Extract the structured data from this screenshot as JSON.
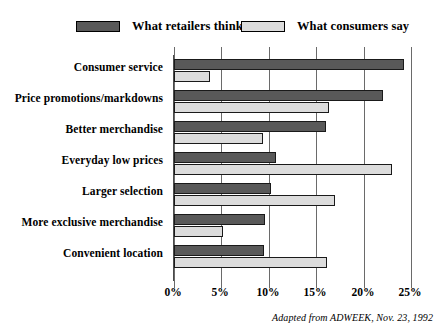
{
  "figure": {
    "caption": "Adapted from ADWEEK, Nov. 23, 1992"
  },
  "legend": {
    "entries": [
      {
        "label": "What retailers think",
        "color": "#595959",
        "swatch_name": "legend-swatch-retailers"
      },
      {
        "label": "What consumers say",
        "color": "#dcdcdc",
        "swatch_name": "legend-swatch-consumers"
      }
    ]
  },
  "axis": {
    "x_ticks": [
      "0%",
      "5%",
      "10%",
      "15%",
      "20%",
      "25%"
    ]
  },
  "chart_data": {
    "type": "bar",
    "orientation": "horizontal",
    "grouped": true,
    "title": "",
    "subtitle": "",
    "xlabel": "",
    "ylabel": "",
    "xlim": [
      0,
      25
    ],
    "xtick_values": [
      0,
      5,
      10,
      15,
      20,
      25
    ],
    "xtick_labels": [
      "0%",
      "5%",
      "10%",
      "15%",
      "20%",
      "25%"
    ],
    "xunit": "%",
    "grid": "vertical",
    "legend_position": "top",
    "categories": [
      "Consumer service",
      "Price promotions/markdowns",
      "Better merchandise",
      "Everyday low prices",
      "Larger selection",
      "More exclusive merchandise",
      "Convenient location"
    ],
    "series": [
      {
        "name": "What retailers think",
        "color": "#595959",
        "values": [
          24.3,
          22.0,
          16.0,
          10.8,
          10.2,
          9.6,
          9.5
        ]
      },
      {
        "name": "What consumers say",
        "color": "#dcdcdc",
        "values": [
          3.8,
          16.3,
          9.4,
          23.0,
          17.0,
          5.2,
          16.1
        ]
      }
    ],
    "annotations": [
      "Adapted from ADWEEK, Nov. 23, 1992"
    ]
  }
}
